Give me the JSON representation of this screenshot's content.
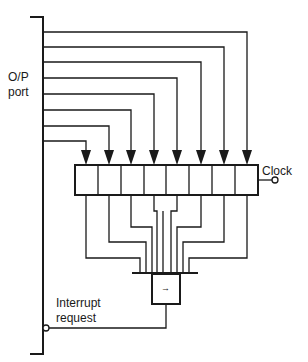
{
  "labels": {
    "port_line1": "O/P",
    "port_line2": "port",
    "clock": "Clock",
    "interrupt_line1": "Interrupt",
    "interrupt_line2": "request",
    "gate_symbol": "→"
  },
  "register": {
    "bits": 8
  },
  "colors": {
    "line": "#1a1a1a",
    "background": "#ffffff"
  }
}
